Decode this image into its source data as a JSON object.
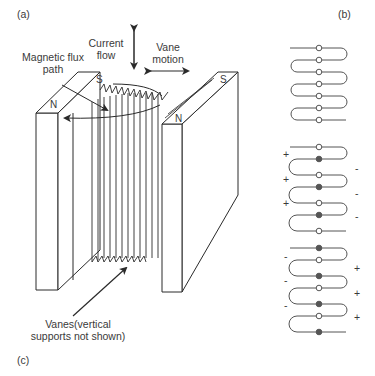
{
  "panels": {
    "a": "(a)",
    "b": "(b)",
    "c": "(c)"
  },
  "labels": {
    "current_flow_line1": "Current",
    "current_flow_line2": "flow",
    "vane_motion_line1": "Vane",
    "vane_motion_line2": "motion",
    "magnetic_flux_line1": "Magnetic flux",
    "magnetic_flux_line2": "path",
    "vanes_line1": "Vanes(vertical",
    "vanes_line2": "supports not shown)"
  },
  "magnet_poles": {
    "left_top_back": "S",
    "left_top_front": "N",
    "right_top_back": "S",
    "right_top_front": "N"
  },
  "panel_b": {
    "top": {
      "signs_left": [],
      "signs_right": [],
      "dots": [
        "o",
        "o",
        "o",
        "o",
        "o",
        "o",
        "o"
      ]
    },
    "middle": {
      "signs_left": [
        "+",
        "+",
        "+"
      ],
      "signs_right": [
        "-",
        "-",
        "-"
      ],
      "dots": [
        "o",
        "x",
        "o",
        "x",
        "o",
        "x",
        "o"
      ]
    },
    "bottom": {
      "signs_left": [
        "-",
        "-",
        "-"
      ],
      "signs_right": [
        "+",
        "+",
        "+"
      ],
      "dots": [
        "x",
        "o",
        "x",
        "o",
        "x",
        "o",
        "x"
      ]
    }
  },
  "colors": {
    "line": "#2a2a2a",
    "text": "#3a3a3a",
    "background": "#ffffff"
  }
}
